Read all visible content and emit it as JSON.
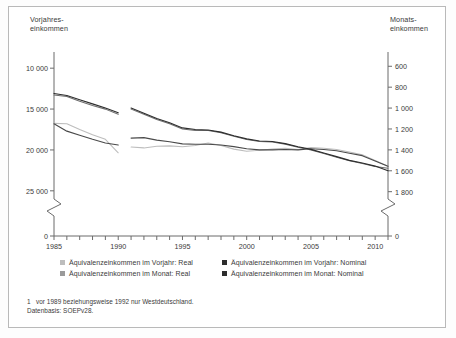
{
  "chart_data": {
    "type": "line",
    "title": "",
    "xlabel": "",
    "ylabel": "Vorjahres-\neinkommen",
    "ylabel_right": "Monats-\neinkommen",
    "xlim": [
      1985,
      2011
    ],
    "ylim": [
      9000,
      26000
    ],
    "ylim_right": [
      540,
      1870
    ],
    "grid": false,
    "legend_position": "bottom",
    "axis_break": true,
    "x_ticks": [
      1985,
      1986,
      1987,
      1988,
      1989,
      1990,
      1991,
      1992,
      1993,
      1994,
      1995,
      1996,
      1997,
      1998,
      1999,
      2000,
      2001,
      2002,
      2003,
      2004,
      2005,
      2006,
      2007,
      2008,
      2009,
      2010,
      2011
    ],
    "x_tick_labels": [
      "1985",
      "1990",
      "1995",
      "2000",
      "2005",
      "2010"
    ],
    "x_tick_label_values": [
      1985,
      1990,
      1995,
      2000,
      2005,
      2010
    ],
    "y_ticks_left": [
      0,
      10000,
      15000,
      20000,
      25000
    ],
    "y_tick_labels_left": [
      "0",
      "10 000",
      "15 000",
      "20 000",
      "25 000"
    ],
    "y_ticks_right": [
      0,
      600,
      800,
      1000,
      1200,
      1400,
      1600,
      1800
    ],
    "y_tick_labels_right": [
      "0",
      "600",
      "800",
      "1 000",
      "1 200",
      "1 400",
      "1 600",
      "1 800"
    ],
    "series": [
      {
        "name": "Äquivalenzeinkommen im Vorjahr: Real",
        "axis": "left",
        "color": "#bdbdbd",
        "segments": [
          {
            "x": [
              1985,
              1986,
              1987,
              1988,
              1989,
              1990
            ],
            "y": [
              16750,
              16800,
              17500,
              18150,
              18700,
              20350
            ]
          },
          {
            "x": [
              1991,
              1992,
              1993,
              1994,
              1995,
              1996,
              1997,
              1998,
              1999,
              2000,
              2001,
              2002,
              2003,
              2004,
              2005,
              2006,
              2007,
              2008,
              2009,
              2010,
              2011
            ],
            "y": [
              19650,
              19750,
              19550,
              19500,
              19600,
              19450,
              19150,
              19450,
              19900,
              20150,
              20050,
              19900,
              19800,
              19950,
              19700,
              19800,
              19950,
              20250,
              20600,
              21300,
              22000
            ]
          }
        ]
      },
      {
        "name": "Äquivalenzeinkommen im Vorjahr: Nominal",
        "axis": "left",
        "color": "#4a4a4a",
        "segments": [
          {
            "x": [
              1985,
              1986,
              1987,
              1988,
              1989,
              1990
            ],
            "y": [
              16800,
              17700,
              18200,
              18700,
              19150,
              19400
            ]
          },
          {
            "x": [
              1991,
              1992,
              1993,
              1994,
              1995,
              1996,
              1997,
              1998,
              1999,
              2000,
              2001,
              2002,
              2003,
              2004,
              2005,
              2006,
              2007,
              2008,
              2009,
              2010,
              2011
            ],
            "y": [
              18550,
              18500,
              18800,
              19000,
              19250,
              19300,
              19300,
              19400,
              19600,
              19850,
              20000,
              20000,
              19950,
              20000,
              19850,
              19950,
              20100,
              20400,
              20700,
              21350,
              22000
            ]
          }
        ]
      },
      {
        "name": "Äquivalenzeinkommen im Monat: Real",
        "axis": "right",
        "color": "#6e6e6e",
        "segments": [
          {
            "x": [
              1985,
              1986,
              1987,
              1988,
              1989,
              1990
            ],
            "y": [
              875,
              890,
              935,
              975,
              1010,
              1060
            ]
          },
          {
            "x": [
              1991,
              1992,
              1993,
              1994,
              1995,
              1996,
              1997,
              1998,
              1999,
              2000,
              2001,
              2002,
              2003,
              2004,
              2005,
              2006,
              2007,
              2008,
              2009,
              2010,
              2011
            ],
            "y": [
              1010,
              1060,
              1110,
              1150,
              1200,
              1215,
              1215,
              1235,
              1270,
              1300,
              1320,
              1325,
              1345,
              1375,
              1400,
              1435,
              1470,
              1505,
              1530,
              1560,
              1575
            ]
          }
        ]
      },
      {
        "name": "Äquivalenzeinkommen im Monat: Nominal",
        "axis": "right",
        "color": "#2d2d2d",
        "segments": [
          {
            "x": [
              1985,
              1986,
              1987,
              1988,
              1989,
              1990
            ],
            "y": [
              860,
              880,
              920,
              960,
              1000,
              1045
            ]
          },
          {
            "x": [
              1991,
              1992,
              1993,
              1994,
              1995,
              1996,
              1997,
              1998,
              1999,
              2000,
              2001,
              2002,
              2003,
              2004,
              2005,
              2006,
              2007,
              2008,
              2009,
              2010,
              2011
            ],
            "y": [
              1000,
              1050,
              1100,
              1140,
              1190,
              1205,
              1210,
              1230,
              1265,
              1295,
              1315,
              1320,
              1340,
              1370,
              1395,
              1430,
              1465,
              1500,
              1525,
              1555,
              1600
            ]
          }
        ]
      }
    ]
  },
  "legend": {
    "items": [
      {
        "label": "Äquivalenzeinkommen im Vorjahr: Real",
        "color": "#bdbdbd"
      },
      {
        "label": "Äquivalenzeinkommen im Vorjahr: Nominal",
        "color": "#2d2d2d"
      },
      {
        "label": "Äquivalenzeinkommen im Monat: Real",
        "color": "#9a9a9a"
      },
      {
        "label": "Äquivalenzeinkommen im Monat: Nominal",
        "color": "#2d2d2d"
      }
    ]
  },
  "footnote": {
    "marker": "1",
    "line1": "vor 1989 beziehungsweise 1992 nur Westdeutschland.",
    "line2": "Datenbasis: SOEPv28."
  }
}
